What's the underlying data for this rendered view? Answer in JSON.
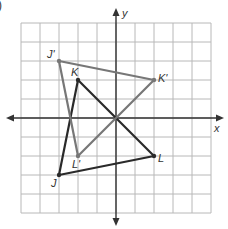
{
  "problem_marker": ")",
  "grid": {
    "min": -5,
    "max": 5,
    "origin_px": [
      116,
      118
    ],
    "unit_px": 19,
    "grid_color": "#b8b8b8",
    "axis_color": "#333333"
  },
  "axes": {
    "x_label": "x",
    "y_label": "y"
  },
  "shapes": [
    {
      "name": "triangle-JKL",
      "color": "#2a2a2a",
      "stroke_width": 2.2,
      "vertices": [
        {
          "label": "J",
          "x": -3,
          "y": -3
        },
        {
          "label": "K",
          "x": -2,
          "y": 2
        },
        {
          "label": "L",
          "x": 2,
          "y": -2
        }
      ]
    },
    {
      "name": "triangle-J'K'L'",
      "color": "#777777",
      "stroke_width": 2.2,
      "vertices": [
        {
          "label": "J'",
          "x": -3,
          "y": 3
        },
        {
          "label": "K'",
          "x": 2,
          "y": 2
        },
        {
          "label": "L'",
          "x": -2,
          "y": -2
        }
      ]
    }
  ],
  "labels": {
    "J": "J",
    "K": "K",
    "L": "L",
    "J_prime": "J'",
    "K_prime": "K'",
    "L_prime": "L'"
  }
}
